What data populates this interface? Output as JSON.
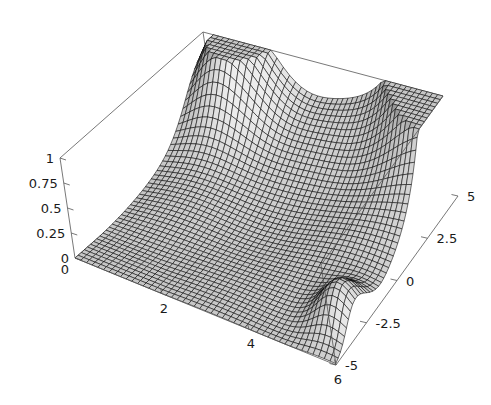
{
  "figure": {
    "kind": "surface-plot-3d",
    "style": "mathematica-plot3d",
    "background_color": "#ffffff",
    "frame_color": "#555555",
    "mesh_color": "#000000",
    "surface_fill_light": "#d4d4d4",
    "surface_fill_dark": "#2a2a2a",
    "label_color": "#1a1a1a"
  },
  "chart_data": {
    "type": "surface",
    "title": "",
    "xlabel": "",
    "ylabel": "",
    "zlabel": "",
    "xlim": [
      0,
      6
    ],
    "ylim": [
      -5,
      5
    ],
    "zlim": [
      0,
      1
    ],
    "grid": false,
    "legend": "none",
    "x_ticks": [
      0,
      2,
      4,
      6
    ],
    "x_tick_labels": [
      "0",
      "2",
      "4",
      "6"
    ],
    "y_ticks": [
      -5,
      -2.5,
      0,
      2.5,
      5
    ],
    "y_tick_labels": [
      "-5",
      "-2.5",
      "0",
      "2.5",
      "5"
    ],
    "z_ticks": [
      0,
      0.25,
      0.5,
      0.75,
      1
    ],
    "z_tick_labels": [
      "0",
      "0.25",
      "0.5",
      "0.75",
      "1"
    ],
    "view": {
      "azimuth_deg": 37,
      "elevation_deg": 27,
      "projection": "orthographic-oblique"
    },
    "mesh": {
      "x_samples": 46,
      "y_samples": 46,
      "shading": "gray-diffuse",
      "wireframe": true
    },
    "surface_description": "Smooth oscillatory ridged surface over x in [0,6], y in [-5,5], clamped to z in [0,1]. Tall ridge rises near the back-left corner (small x, large y), a second tall ridge rises at the far right corner (large x, large y), and a sharp dark fold peak appears at the front-right (large x, negative y). A broad low basin occupies the left and front-middle of the domain.",
    "features": [
      {
        "name": "back-left-ridge",
        "x": 0.9,
        "y": 4.6,
        "z": 1.0
      },
      {
        "name": "right-corner-ridge",
        "x": 5.9,
        "y": 4.9,
        "z": 1.0
      },
      {
        "name": "front-right-fold-peak",
        "x": 5.6,
        "y": -3.2,
        "z": 0.72
      },
      {
        "name": "central-saddle",
        "x": 3.1,
        "y": 0.4,
        "z": 0.34
      },
      {
        "name": "left-basin",
        "x": 1.4,
        "y": -1.8,
        "z": 0.05
      }
    ],
    "z_samples": {
      "x_grid": [
        0,
        0.75,
        1.5,
        2.25,
        3,
        3.75,
        4.5,
        5.25,
        6
      ],
      "y_grid": [
        -5,
        -3.75,
        -2.5,
        -1.25,
        0,
        1.25,
        2.5,
        3.75,
        5
      ],
      "values": [
        [
          0.03,
          0.05,
          0.08,
          0.11,
          0.1,
          0.06,
          0.04,
          0.02,
          0.02
        ],
        [
          0.04,
          0.07,
          0.12,
          0.18,
          0.21,
          0.17,
          0.11,
          0.07,
          0.05
        ],
        [
          0.05,
          0.09,
          0.16,
          0.26,
          0.34,
          0.32,
          0.24,
          0.16,
          0.11
        ],
        [
          0.06,
          0.11,
          0.21,
          0.36,
          0.5,
          0.52,
          0.43,
          0.31,
          0.22
        ],
        [
          0.06,
          0.12,
          0.24,
          0.43,
          0.63,
          0.71,
          0.63,
          0.48,
          0.36
        ],
        [
          0.06,
          0.12,
          0.25,
          0.46,
          0.71,
          0.85,
          0.8,
          0.65,
          0.51
        ],
        [
          0.05,
          0.11,
          0.23,
          0.44,
          0.71,
          0.92,
          0.92,
          0.79,
          0.65
        ],
        [
          0.04,
          0.09,
          0.19,
          0.38,
          0.64,
          0.9,
          0.97,
          0.9,
          0.79
        ],
        [
          0.03,
          0.07,
          0.15,
          0.3,
          0.53,
          0.8,
          0.96,
          0.97,
          0.9
        ]
      ]
    }
  },
  "axes": {
    "z_axis": {
      "name": "vertical-axis",
      "ticks": [
        "1",
        "0.75",
        "0.5",
        "0.25",
        "0"
      ]
    },
    "x_axis": {
      "name": "front-left-axis",
      "ticks": [
        "0",
        "2",
        "4",
        "6"
      ]
    },
    "y_axis": {
      "name": "front-right-axis",
      "ticks": [
        "5",
        "2.5",
        "0",
        "-2.5",
        "-5"
      ]
    }
  }
}
